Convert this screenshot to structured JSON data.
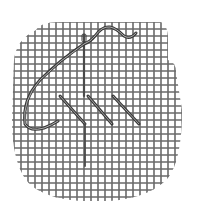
{
  "illustration": {
    "subject": "needlepoint canvas with needle and thread working tent stitches",
    "colors": {
      "background": "#ffffff",
      "canvas_thread": "#6a6a6a",
      "yarn": "#3a3a3a",
      "yarn_highlight": "#bdbdbd",
      "needle": "#4a4a4a"
    },
    "grid": {
      "spacing": 7,
      "x_start": 14,
      "x_end": 182,
      "y_start": 22,
      "y_end": 201
    },
    "stitches": [
      {
        "x1": 60,
        "y1": 96,
        "x2": 85,
        "y2": 124
      },
      {
        "x1": 88,
        "y1": 96,
        "x2": 112,
        "y2": 124
      },
      {
        "x1": 113,
        "y1": 96,
        "x2": 139,
        "y2": 124
      }
    ]
  }
}
